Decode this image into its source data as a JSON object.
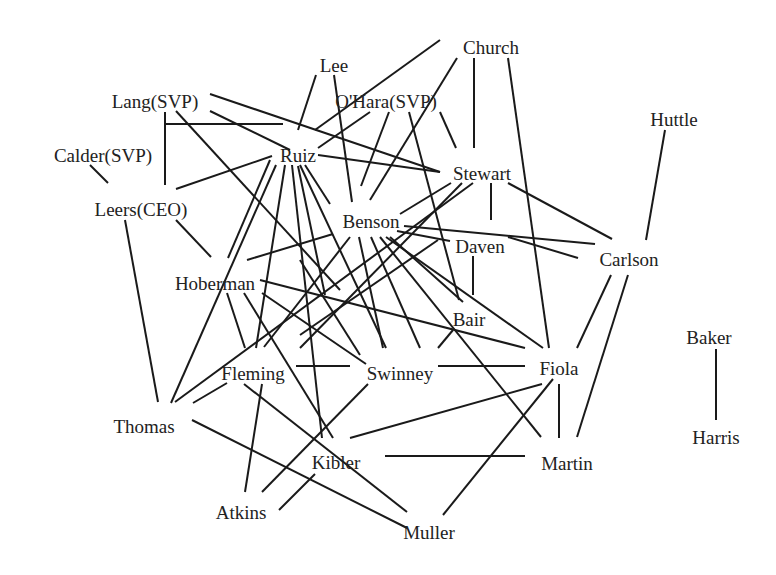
{
  "diagram": {
    "type": "network",
    "nodes": [
      {
        "id": "church",
        "label": "Church",
        "x": 491,
        "y": 47
      },
      {
        "id": "lee",
        "label": "Lee",
        "x": 334,
        "y": 65
      },
      {
        "id": "lang",
        "label": "Lang(SVP)",
        "x": 155,
        "y": 101
      },
      {
        "id": "ohara",
        "label": "O'Hara(SVP)",
        "x": 386,
        "y": 101
      },
      {
        "id": "huttle",
        "label": "Huttle",
        "x": 674,
        "y": 119
      },
      {
        "id": "calder",
        "label": "Calder(SVP)",
        "x": 103,
        "y": 155
      },
      {
        "id": "ruiz",
        "label": "Ruiz",
        "x": 298,
        "y": 155
      },
      {
        "id": "stewart",
        "label": "Stewart",
        "x": 482,
        "y": 173
      },
      {
        "id": "leers",
        "label": "Leers(CEO)",
        "x": 141,
        "y": 209
      },
      {
        "id": "benson",
        "label": "Benson",
        "x": 371,
        "y": 221
      },
      {
        "id": "daven",
        "label": "Daven",
        "x": 480,
        "y": 246
      },
      {
        "id": "carlson",
        "label": "Carlson",
        "x": 629,
        "y": 259
      },
      {
        "id": "hoberman",
        "label": "Hoberman",
        "x": 215,
        "y": 283
      },
      {
        "id": "bair",
        "label": "Bair",
        "x": 469,
        "y": 319
      },
      {
        "id": "baker",
        "label": "Baker",
        "x": 709,
        "y": 337
      },
      {
        "id": "fleming",
        "label": "Fleming",
        "x": 253,
        "y": 373
      },
      {
        "id": "swinney",
        "label": "Swinney",
        "x": 400,
        "y": 373
      },
      {
        "id": "fiola",
        "label": "Fiola",
        "x": 559,
        "y": 368
      },
      {
        "id": "thomas",
        "label": "Thomas",
        "x": 144,
        "y": 426
      },
      {
        "id": "harris",
        "label": "Harris",
        "x": 716,
        "y": 437
      },
      {
        "id": "kibler",
        "label": "Kibler",
        "x": 336,
        "y": 462
      },
      {
        "id": "martin",
        "label": "Martin",
        "x": 567,
        "y": 463
      },
      {
        "id": "atkins",
        "label": "Atkins",
        "x": 241,
        "y": 512
      },
      {
        "id": "muller",
        "label": "Muller",
        "x": 429,
        "y": 532
      }
    ],
    "edges": [
      {
        "from": "lang",
        "to": "leers",
        "x1": 165,
        "y1": 112,
        "x2": 165,
        "y2": 185
      },
      {
        "from": "lang",
        "to": "ruiz",
        "x1": 165,
        "y1": 124,
        "x2": 283,
        "y2": 124
      },
      {
        "from": "lang",
        "to": "ruiz2",
        "x1": 210,
        "y1": 111,
        "x2": 290,
        "y2": 150
      },
      {
        "from": "lang",
        "to": "stewart",
        "x1": 210,
        "y1": 94,
        "x2": 440,
        "y2": 172
      },
      {
        "from": "lang",
        "to": "swinney",
        "x1": 176,
        "y1": 111,
        "x2": 340,
        "y2": 290
      },
      {
        "from": "lang",
        "to": "kibler",
        "x1": 300,
        "y1": 260,
        "x2": 360,
        "y2": 355
      },
      {
        "from": "calder",
        "to": "leers",
        "x1": 90,
        "y1": 165,
        "x2": 108,
        "y2": 183
      },
      {
        "from": "leers",
        "to": "ruiz",
        "x1": 176,
        "y1": 189,
        "x2": 272,
        "y2": 156
      },
      {
        "from": "leers",
        "to": "hoberman",
        "x1": 176,
        "y1": 220,
        "x2": 211,
        "y2": 257
      },
      {
        "from": "leers",
        "to": "thomas",
        "x1": 125,
        "y1": 220,
        "x2": 158,
        "y2": 402
      },
      {
        "from": "lee",
        "to": "ruiz",
        "x1": 316,
        "y1": 75,
        "x2": 298,
        "y2": 130
      },
      {
        "from": "lee",
        "to": "benson",
        "x1": 334,
        "y1": 75,
        "x2": 352,
        "y2": 202
      },
      {
        "from": "church",
        "to": "ruiz",
        "x1": 440,
        "y1": 40,
        "x2": 315,
        "y2": 130
      },
      {
        "from": "church",
        "to": "benson",
        "x1": 457,
        "y1": 58,
        "x2": 370,
        "y2": 200
      },
      {
        "from": "church",
        "to": "stewart",
        "x1": 474,
        "y1": 58,
        "x2": 474,
        "y2": 148
      },
      {
        "from": "church",
        "to": "fiola",
        "x1": 508,
        "y1": 58,
        "x2": 549,
        "y2": 348
      },
      {
        "from": "ohara",
        "to": "ruiz",
        "x1": 370,
        "y1": 112,
        "x2": 318,
        "y2": 148
      },
      {
        "from": "ohara",
        "to": "benson",
        "x1": 389,
        "y1": 112,
        "x2": 361,
        "y2": 186
      },
      {
        "from": "ohara",
        "to": "stewart",
        "x1": 440,
        "y1": 112,
        "x2": 456,
        "y2": 148
      },
      {
        "from": "ohara",
        "to": "bair",
        "x1": 409,
        "y1": 112,
        "x2": 459,
        "y2": 300
      },
      {
        "from": "huttle",
        "to": "carlson",
        "x1": 665,
        "y1": 130,
        "x2": 646,
        "y2": 240
      },
      {
        "from": "ruiz",
        "to": "stewart",
        "x1": 318,
        "y1": 155,
        "x2": 440,
        "y2": 172
      },
      {
        "from": "ruiz",
        "to": "benson",
        "x1": 305,
        "y1": 165,
        "x2": 330,
        "y2": 204
      },
      {
        "from": "ruiz",
        "to": "hoberman",
        "x1": 270,
        "y1": 160,
        "x2": 228,
        "y2": 258
      },
      {
        "from": "ruiz",
        "to": "thomas",
        "x1": 276,
        "y1": 165,
        "x2": 171,
        "y2": 403
      },
      {
        "from": "ruiz",
        "to": "fleming",
        "x1": 285,
        "y1": 165,
        "x2": 256,
        "y2": 348
      },
      {
        "from": "ruiz",
        "to": "kibler",
        "x1": 292,
        "y1": 165,
        "x2": 322,
        "y2": 438
      },
      {
        "from": "ruiz",
        "to": "swinney",
        "x1": 300,
        "y1": 165,
        "x2": 386,
        "y2": 348
      },
      {
        "from": "ruiz",
        "to": "martin",
        "x1": 298,
        "y1": 166,
        "x2": 325,
        "y2": 295
      },
      {
        "from": "stewart",
        "to": "benson",
        "x1": 451,
        "y1": 183,
        "x2": 400,
        "y2": 214
      },
      {
        "from": "stewart",
        "to": "daven",
        "x1": 491,
        "y1": 183,
        "x2": 491,
        "y2": 220
      },
      {
        "from": "stewart",
        "to": "carlson",
        "x1": 508,
        "y1": 183,
        "x2": 612,
        "y2": 239
      },
      {
        "from": "stewart",
        "to": "thomas",
        "x1": 473,
        "y1": 183,
        "x2": 175,
        "y2": 402
      },
      {
        "from": "stewart",
        "to": "swinney",
        "x1": 462,
        "y1": 183,
        "x2": 300,
        "y2": 348
      },
      {
        "from": "benson",
        "to": "daven",
        "x1": 397,
        "y1": 231,
        "x2": 450,
        "y2": 241
      },
      {
        "from": "benson",
        "to": "carlson",
        "x1": 404,
        "y1": 226,
        "x2": 595,
        "y2": 244
      },
      {
        "from": "benson",
        "to": "hoberman",
        "x1": 333,
        "y1": 234,
        "x2": 247,
        "y2": 260
      },
      {
        "from": "benson",
        "to": "fleming",
        "x1": 350,
        "y1": 237,
        "x2": 264,
        "y2": 347
      },
      {
        "from": "benson",
        "to": "kibler",
        "x1": 359,
        "y1": 237,
        "x2": 383,
        "y2": 348
      },
      {
        "from": "benson",
        "to": "swinney",
        "x1": 371,
        "y1": 237,
        "x2": 420,
        "y2": 348
      },
      {
        "from": "benson",
        "to": "fiola",
        "x1": 386,
        "y1": 237,
        "x2": 543,
        "y2": 348
      },
      {
        "from": "benson",
        "to": "martin",
        "x1": 380,
        "y1": 237,
        "x2": 541,
        "y2": 437
      },
      {
        "from": "benson",
        "to": "bair",
        "x1": 390,
        "y1": 237,
        "x2": 463,
        "y2": 302
      },
      {
        "from": "daven",
        "to": "carlson",
        "x1": 508,
        "y1": 237,
        "x2": 578,
        "y2": 258
      },
      {
        "from": "daven",
        "to": "bair",
        "x1": 473,
        "y1": 256,
        "x2": 473,
        "y2": 295
      },
      {
        "from": "daven",
        "to": "fleming",
        "x1": 438,
        "y1": 240,
        "x2": 300,
        "y2": 335
      },
      {
        "from": "carlson",
        "to": "fiola",
        "x1": 611,
        "y1": 275,
        "x2": 577,
        "y2": 348
      },
      {
        "from": "carlson",
        "to": "martin",
        "x1": 628,
        "y1": 275,
        "x2": 577,
        "y2": 437
      },
      {
        "from": "hoberman",
        "to": "fleming",
        "x1": 227,
        "y1": 293,
        "x2": 245,
        "y2": 348
      },
      {
        "from": "hoberman",
        "to": "kibler",
        "x1": 244,
        "y1": 293,
        "x2": 333,
        "y2": 438
      },
      {
        "from": "hoberman",
        "to": "swinney",
        "x1": 262,
        "y1": 293,
        "x2": 366,
        "y2": 364
      },
      {
        "from": "hoberman",
        "to": "fiola",
        "x1": 260,
        "y1": 280,
        "x2": 525,
        "y2": 348
      },
      {
        "from": "bair",
        "to": "swinney",
        "x1": 453,
        "y1": 330,
        "x2": 438,
        "y2": 348
      },
      {
        "from": "fleming",
        "to": "thomas",
        "x1": 227,
        "y1": 383,
        "x2": 193,
        "y2": 403
      },
      {
        "from": "fleming",
        "to": "swinney",
        "x1": 296,
        "y1": 366,
        "x2": 350,
        "y2": 366
      },
      {
        "from": "fleming",
        "to": "atkins",
        "x1": 262,
        "y1": 384,
        "x2": 245,
        "y2": 492
      },
      {
        "from": "fleming",
        "to": "muller",
        "x1": 244,
        "y1": 384,
        "x2": 407,
        "y2": 512
      },
      {
        "from": "swinney",
        "to": "fiola",
        "x1": 438,
        "y1": 366,
        "x2": 525,
        "y2": 366
      },
      {
        "from": "swinney",
        "to": "atkins",
        "x1": 368,
        "y1": 384,
        "x2": 262,
        "y2": 492
      },
      {
        "from": "fiola",
        "to": "kibler",
        "x1": 542,
        "y1": 384,
        "x2": 350,
        "y2": 438
      },
      {
        "from": "fiola",
        "to": "martin",
        "x1": 559,
        "y1": 384,
        "x2": 559,
        "y2": 438
      },
      {
        "from": "fiola",
        "to": "muller",
        "x1": 553,
        "y1": 379,
        "x2": 443,
        "y2": 515
      },
      {
        "from": "thomas",
        "to": "muller",
        "x1": 192,
        "y1": 420,
        "x2": 407,
        "y2": 528
      },
      {
        "from": "kibler",
        "to": "martin",
        "x1": 385,
        "y1": 456,
        "x2": 525,
        "y2": 456
      },
      {
        "from": "kibler",
        "to": "atkins",
        "x1": 315,
        "y1": 474,
        "x2": 279,
        "y2": 510
      },
      {
        "from": "baker",
        "to": "harris",
        "x1": 716,
        "y1": 349,
        "x2": 716,
        "y2": 420
      }
    ]
  }
}
